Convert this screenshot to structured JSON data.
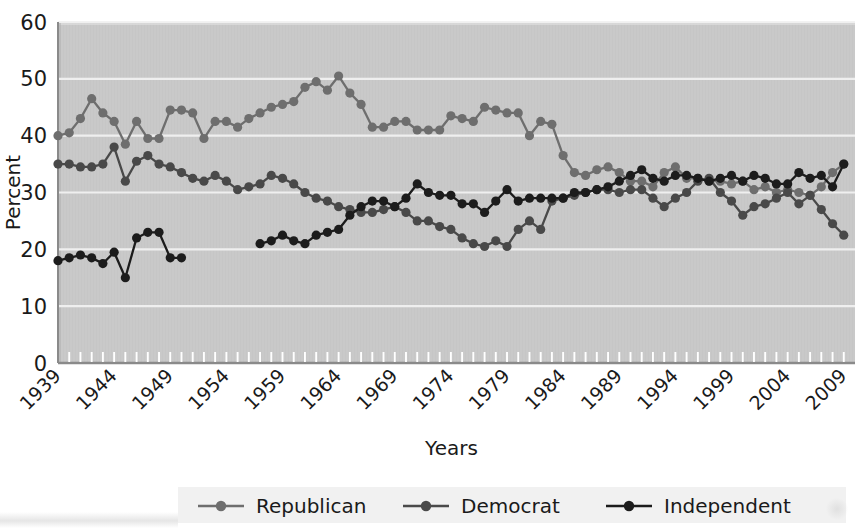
{
  "figure": {
    "background": "#ffffff",
    "plot_background": "#c9c9c9",
    "gridline_color": "#f2f2f2",
    "axis_color": "#7a7a7a",
    "text_color": "#1a1a1a"
  },
  "axes": {
    "ylabel": "Percent",
    "xlabel": "Years",
    "y_ticks": [
      "0",
      "10",
      "20",
      "30",
      "40",
      "50",
      "60"
    ],
    "x_ticks": [
      "1939",
      "1944",
      "1949",
      "1954",
      "1959",
      "1964",
      "1969",
      "1974",
      "1979",
      "1984",
      "1989",
      "1994",
      "1999",
      "2004",
      "2009"
    ],
    "x_tick_rotation_degrees": 45
  },
  "legend": {
    "position": "bottom-center",
    "background": "#f1f1f1",
    "items": [
      {
        "label": "Republican",
        "color": "#6e6e6e"
      },
      {
        "label": "Democrat",
        "color": "#4a4a4a"
      },
      {
        "label": "Independent",
        "color": "#1c1c1c"
      }
    ]
  },
  "chart_data": {
    "type": "line",
    "title": "",
    "xlabel": "Years",
    "ylabel": "Percent",
    "xlim": [
      1939,
      2010
    ],
    "ylim": [
      0,
      60
    ],
    "grid": true,
    "legend_position": "bottom-center",
    "marker": "circle",
    "x": [
      1939,
      1940,
      1941,
      1942,
      1943,
      1944,
      1945,
      1946,
      1947,
      1948,
      1949,
      1950,
      1951,
      1952,
      1953,
      1954,
      1955,
      1956,
      1957,
      1958,
      1959,
      1960,
      1961,
      1962,
      1963,
      1964,
      1965,
      1966,
      1967,
      1968,
      1969,
      1970,
      1971,
      1972,
      1973,
      1974,
      1975,
      1976,
      1977,
      1978,
      1979,
      1980,
      1981,
      1982,
      1983,
      1984,
      1985,
      1986,
      1987,
      1988,
      1989,
      1990,
      1991,
      1992,
      1993,
      1994,
      1995,
      1996,
      1997,
      1998,
      1999,
      2000,
      2001,
      2002,
      2003,
      2004,
      2005,
      2006,
      2007,
      2008,
      2009
    ],
    "series": [
      {
        "name": "Republican",
        "color": "#6e6e6e",
        "values": [
          40.0,
          40.5,
          43.0,
          46.5,
          44.0,
          42.5,
          38.5,
          42.5,
          39.5,
          39.5,
          44.5,
          44.5,
          44.0,
          39.5,
          42.5,
          42.5,
          41.5,
          43.0,
          44.0,
          45.0,
          45.5,
          46.0,
          48.5,
          49.5,
          48.0,
          50.5,
          47.5,
          45.5,
          41.5,
          41.5,
          42.5,
          42.5,
          41.0,
          41.0,
          41.0,
          43.5,
          43.0,
          42.5,
          45.0,
          44.5,
          44.0,
          44.0,
          40.0,
          42.5,
          42.0,
          36.5,
          33.5,
          33.0,
          34.0,
          34.5,
          33.5,
          32.0,
          32.0,
          31.0,
          33.5,
          34.5,
          32.5,
          32.5,
          32.0,
          32.0,
          31.5,
          32.0,
          30.5,
          31.0,
          30.0,
          30.5,
          30.0,
          29.5,
          31.0,
          33.5,
          35.0
        ]
      },
      {
        "name": "Democrat",
        "color": "#4a4a4a",
        "values": [
          35.0,
          35.0,
          34.5,
          34.5,
          35.0,
          38.0,
          32.0,
          35.5,
          36.5,
          35.0,
          34.5,
          33.5,
          32.5,
          32.0,
          33.0,
          32.0,
          30.5,
          31.0,
          31.5,
          33.0,
          32.5,
          31.5,
          30.0,
          29.0,
          28.5,
          27.5,
          27.0,
          26.5,
          26.5,
          27.0,
          27.5,
          26.5,
          25.0,
          25.0,
          24.0,
          23.5,
          22.0,
          21.0,
          20.5,
          21.5,
          20.5,
          23.5,
          25.0,
          23.5,
          28.5,
          29.0,
          29.5,
          30.0,
          30.5,
          30.5,
          30.0,
          30.5,
          30.5,
          29.0,
          27.5,
          29.0,
          30.0,
          32.0,
          32.5,
          30.0,
          28.5,
          26.0,
          27.5,
          28.0,
          29.0,
          30.0,
          28.0,
          29.5,
          27.0,
          24.5,
          22.5
        ]
      },
      {
        "name": "Independent",
        "color": "#1c1c1c",
        "values": [
          18.0,
          18.5,
          19.0,
          18.5,
          17.5,
          19.5,
          15.0,
          22.0,
          23.0,
          23.0,
          18.5,
          18.5,
          null,
          null,
          null,
          null,
          null,
          null,
          21.0,
          21.5,
          22.5,
          21.5,
          21.0,
          22.5,
          23.0,
          23.5,
          26.0,
          27.5,
          28.5,
          28.5,
          27.5,
          29.0,
          31.5,
          30.0,
          29.5,
          29.5,
          28.0,
          28.0,
          26.5,
          28.5,
          30.5,
          28.5,
          29.0,
          29.0,
          29.0,
          29.0,
          30.0,
          30.0,
          30.5,
          31.0,
          32.0,
          33.0,
          34.0,
          32.5,
          32.0,
          33.0,
          33.0,
          32.5,
          32.0,
          32.5,
          33.0,
          32.0,
          33.0,
          32.5,
          31.5,
          31.5,
          33.5,
          32.5,
          33.0,
          31.0,
          35.0
        ]
      }
    ]
  }
}
